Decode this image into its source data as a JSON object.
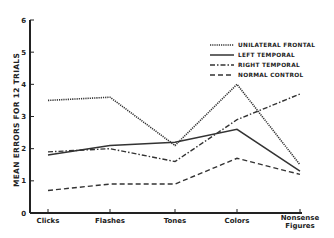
{
  "chart_data": {
    "type": "line",
    "title": "",
    "xlabel": "",
    "ylabel": "MEAN ERRORS FOR 12 TRIALS",
    "ylim": [
      0,
      6
    ],
    "yticks": [
      "0",
      "1",
      "2",
      "3",
      "4",
      "5",
      "6"
    ],
    "categories": [
      "Clicks",
      "Flashes",
      "Tones",
      "Colors",
      "Nonsense Figures"
    ],
    "grid": false,
    "legend_position": "top-right",
    "series": [
      {
        "name": "UNILATERAL FRONTAL",
        "style": "dotted",
        "values": [
          3.5,
          3.6,
          2.1,
          4.0,
          1.5
        ]
      },
      {
        "name": "LEFT TEMPORAL",
        "style": "solid",
        "values": [
          1.8,
          2.1,
          2.2,
          2.6,
          1.3
        ]
      },
      {
        "name": "RIGHT TEMPORAL",
        "style": "dash-dot",
        "values": [
          1.9,
          2.0,
          1.6,
          2.9,
          3.7
        ]
      },
      {
        "name": "NORMAL CONTROL",
        "style": "dashed",
        "values": [
          0.7,
          0.9,
          0.9,
          1.7,
          1.2
        ]
      }
    ]
  }
}
